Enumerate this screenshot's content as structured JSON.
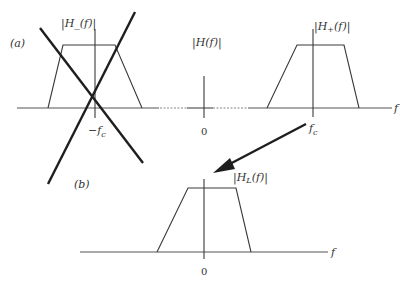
{
  "diagram": {
    "part_a": {
      "label": "(a)",
      "axis_label": "f",
      "center_label": "|H(f)|",
      "center_tick": "0",
      "left_filter": {
        "label": "|H_(f)|",
        "tick": "−f",
        "tick_sub": "c",
        "crossed_out": true
      },
      "right_filter": {
        "label": "|H",
        "label_sub": "+",
        "label_tail": "(f)|",
        "tick": "f",
        "tick_sub": "c"
      }
    },
    "part_b": {
      "label": "(b)",
      "axis_label": "f",
      "filter": {
        "label": "|H",
        "label_sub": "L",
        "label_tail": "(f)|",
        "tick": "0"
      }
    },
    "arrow": {
      "from": "right_filter",
      "to": "part_b_filter"
    },
    "colors": {
      "stroke": "#1e1e1e",
      "axis": "#555555",
      "background": "#ffffff"
    }
  }
}
